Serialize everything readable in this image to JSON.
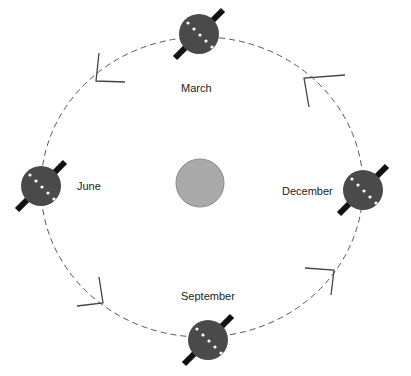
{
  "diagram": {
    "center_body": {
      "name": "Sun",
      "color": "#aaaaaa"
    },
    "orbit": {
      "style": "dashed",
      "direction": "counter-clockwise arrows"
    },
    "positions": [
      {
        "label": "March",
        "x": 199,
        "y": 34
      },
      {
        "label": "June",
        "x": 41,
        "y": 186
      },
      {
        "label": "December",
        "x": 363,
        "y": 190
      },
      {
        "label": "September",
        "x": 208,
        "y": 340
      }
    ],
    "colors": {
      "planet": "#4a4a4a",
      "axis": "#111111",
      "equator_dots": "#ffffff",
      "orbit": "#555555"
    }
  }
}
